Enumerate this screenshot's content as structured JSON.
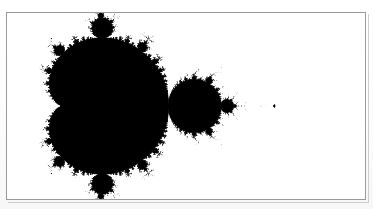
{
  "page": {
    "background_color": "#fdfdfd",
    "width": 373,
    "height": 209,
    "caption": ""
  },
  "figure": {
    "title": "",
    "frame": {
      "border_color": "#9a9a9a",
      "border_width_px": 1,
      "left_px": 6,
      "top_px": 12,
      "width_px": 360,
      "height_px": 188,
      "background_color": "#ffffff"
    },
    "image": {
      "kind": "mandelbrot-set",
      "set_color": "#000000",
      "exterior_color": "#ffffff",
      "orientation": "mirrored-horizontal",
      "description": "Mandelbrot set rendered in black on white; main cardioid and period-2 bulb at left, long antenna filament extending to the right with mini-Mandelbrot islands along it."
    }
  },
  "chart_data": {
    "type": "scatter",
    "xlabel": "",
    "ylabel": "",
    "grid": false,
    "legend": null,
    "render": {
      "algorithm": "escape-time",
      "formula": "z -> z^2 + c",
      "max_iterations": 420,
      "escape_radius": 2,
      "inside_color": "#000000",
      "outside_color": "#ffffff",
      "threshold_shading": true
    },
    "complex_plane_window": {
      "re_min": -2.62,
      "re_max": 0.78,
      "im_min": -0.89,
      "im_max": 0.89,
      "note": "Re axis is drawn right-to-left so the antenna points toward the right edge of the frame."
    },
    "features": [
      {
        "name": "main-cardioid",
        "center_re": -0.15,
        "center_im": 0.0,
        "period": 1
      },
      {
        "name": "period-2-bulb",
        "center_re": -1.0,
        "center_im": 0.0,
        "period": 2
      },
      {
        "name": "period-3-upper-bulb",
        "center_re": -0.125,
        "center_im": 0.744,
        "period": 3
      },
      {
        "name": "period-3-lower-bulb",
        "center_re": -0.125,
        "center_im": -0.744,
        "period": 3
      },
      {
        "name": "antenna-filament",
        "re_start": -1.4,
        "re_end": -2.0,
        "im": 0.0
      },
      {
        "name": "period-3-mini-mandelbrot",
        "center_re": -1.7548,
        "center_im": 0.0,
        "period": 3
      },
      {
        "name": "period-4-mini-mandelbrot",
        "center_re": -1.9408,
        "center_im": 0.0,
        "period": 4
      },
      {
        "name": "needle-tip",
        "center_re": -2.0,
        "center_im": 0.0
      }
    ]
  }
}
